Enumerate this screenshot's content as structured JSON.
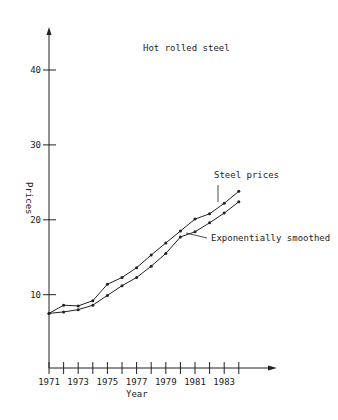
{
  "chart_data": {
    "type": "line",
    "title": "Hot rolled steel",
    "xlabel": "Year",
    "ylabel": "Prices",
    "ylim": [
      0,
      45
    ],
    "y_ticks": [
      10,
      20,
      30,
      40
    ],
    "x_tick_labels": [
      "1971",
      "1973",
      "1975",
      "1977",
      "1979",
      "1981",
      "1983"
    ],
    "x": [
      1971,
      1972,
      1973,
      1974,
      1975,
      1976,
      1977,
      1978,
      1979,
      1980,
      1981,
      1982,
      1983,
      1984
    ],
    "series": [
      {
        "name": "Steel prices",
        "values": [
          7.5,
          8.6,
          8.5,
          9.2,
          11.4,
          12.3,
          13.6,
          15.3,
          16.9,
          18.5,
          20.1,
          20.8,
          22.2,
          23.8
        ]
      },
      {
        "name": "Exponentially smoothed",
        "values": [
          7.5,
          7.7,
          8.0,
          8.6,
          9.9,
          11.2,
          12.3,
          13.8,
          15.5,
          17.7,
          18.4,
          19.6,
          20.9,
          22.4
        ]
      }
    ],
    "annotations": [
      {
        "text": "Steel prices",
        "points_to": "Steel prices",
        "near_x": 1982
      },
      {
        "text": "Exponentially smoothed",
        "points_to": "Exponentially smoothed",
        "near_x": 1980
      }
    ],
    "grid": false,
    "legend": "inline annotations",
    "colors": {
      "line": "#222222",
      "text": "#222222",
      "background": "#ffffff"
    }
  }
}
